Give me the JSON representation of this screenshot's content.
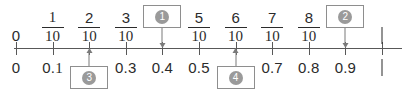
{
  "worksheet": {
    "type": "number-line",
    "orientation": "horizontal",
    "range": [
      0,
      1
    ],
    "tick_count": 11,
    "tick_step": 0.1,
    "colors": {
      "axis": "#585858",
      "text": "#2b2b2b",
      "box_border": "#8e8e8e",
      "marker_fill": "#9a9a9a",
      "marker_text": "#ffffff",
      "arrow": "#7a7a7a"
    }
  },
  "top_row": {
    "description": "fraction labels above the number line",
    "labels": [
      {
        "value": 0.0,
        "kind": "integer",
        "text": "0"
      },
      {
        "value": 0.1,
        "kind": "fraction",
        "numerator": "1",
        "denominator": "10"
      },
      {
        "value": 0.2,
        "kind": "fraction",
        "numerator": "2",
        "denominator": "10"
      },
      {
        "value": 0.3,
        "kind": "fraction",
        "numerator": "3",
        "denominator": "10"
      },
      {
        "value": 0.4,
        "kind": "answer-box",
        "marker": "1"
      },
      {
        "value": 0.5,
        "kind": "fraction",
        "numerator": "5",
        "denominator": "10"
      },
      {
        "value": 0.6,
        "kind": "fraction",
        "numerator": "6",
        "denominator": "10"
      },
      {
        "value": 0.7,
        "kind": "fraction",
        "numerator": "7",
        "denominator": "10"
      },
      {
        "value": 0.8,
        "kind": "fraction",
        "numerator": "8",
        "denominator": "10"
      },
      {
        "value": 0.9,
        "kind": "answer-box",
        "marker": "2"
      },
      {
        "value": 1.0,
        "kind": "integer",
        "text": "1"
      }
    ]
  },
  "bottom_row": {
    "description": "decimal labels below the number line",
    "labels": [
      {
        "value": 0.0,
        "kind": "decimal",
        "text": "0"
      },
      {
        "value": 0.1,
        "kind": "decimal",
        "text": "0.1"
      },
      {
        "value": 0.2,
        "kind": "answer-box",
        "marker": "3"
      },
      {
        "value": 0.3,
        "kind": "decimal",
        "text": "0.3"
      },
      {
        "value": 0.4,
        "kind": "decimal",
        "text": "0.4"
      },
      {
        "value": 0.5,
        "kind": "decimal",
        "text": "0.5"
      },
      {
        "value": 0.6,
        "kind": "answer-box",
        "marker": "4"
      },
      {
        "value": 0.7,
        "kind": "decimal",
        "text": "0.7"
      },
      {
        "value": 0.8,
        "kind": "decimal",
        "text": "0.8"
      },
      {
        "value": 0.9,
        "kind": "decimal",
        "text": "0.9"
      },
      {
        "value": 1.0,
        "kind": "decimal",
        "text": "1"
      }
    ]
  },
  "answer_boxes": [
    {
      "id": "1",
      "marker": "1",
      "position_value": 0.4,
      "side": "above",
      "arrow": "down",
      "expected_label": "4/10"
    },
    {
      "id": "2",
      "marker": "2",
      "position_value": 0.9,
      "side": "above",
      "arrow": "down",
      "expected_label": "9/10"
    },
    {
      "id": "3",
      "marker": "3",
      "position_value": 0.2,
      "side": "below",
      "arrow": "up",
      "expected_label": "0.2"
    },
    {
      "id": "4",
      "marker": "4",
      "position_value": 0.6,
      "side": "below",
      "arrow": "up",
      "expected_label": "0.6"
    }
  ]
}
